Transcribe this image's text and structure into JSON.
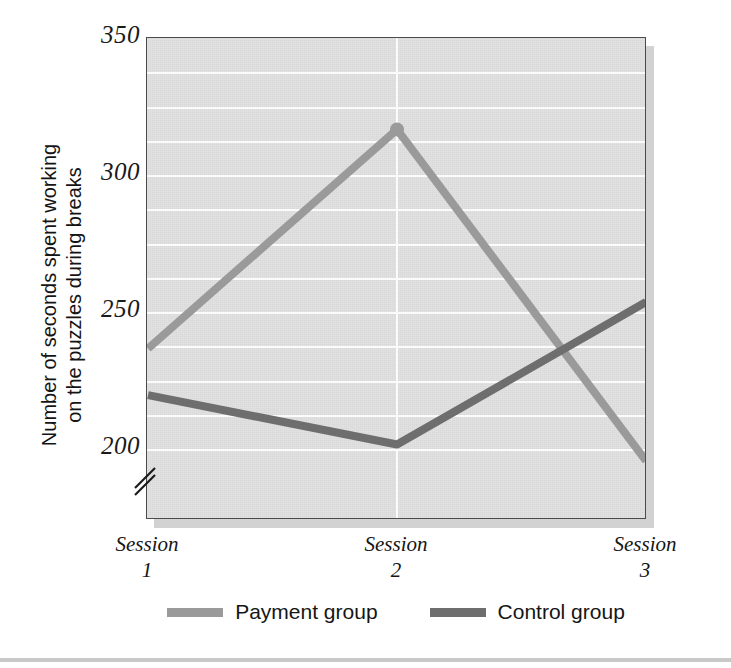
{
  "chart_data": {
    "type": "line",
    "title": "",
    "xlabel": "",
    "ylabel": "Number of seconds spent working on the puzzles during breaks",
    "ylabel_line1": "Number of seconds spent working",
    "ylabel_line2": "on the puzzles during breaks",
    "categories": [
      "Session 1",
      "Session 2",
      "Session 3"
    ],
    "category_lines": [
      {
        "word": "Session",
        "number": "1"
      },
      {
        "word": "Session",
        "number": "2"
      },
      {
        "word": "Session",
        "number": "3"
      }
    ],
    "series": [
      {
        "name": "Payment group",
        "color": "#9a9a9a",
        "values": [
          237,
          317,
          196
        ]
      },
      {
        "name": "Control group",
        "color": "#6e6e6e",
        "values": [
          220,
          202,
          254
        ]
      }
    ],
    "ylim": [
      187,
      350
    ],
    "yticks": [
      200,
      250,
      300,
      350
    ],
    "ytick_labels": [
      "200",
      "250",
      "300",
      "350"
    ],
    "gridlines_minor_step": 12.5,
    "grid": true,
    "grid_color": "#fbfbfb",
    "plot_background": "#e0e0e0",
    "axis_break": true,
    "legend_position": "bottom"
  },
  "legend": {
    "entries": [
      {
        "label": "Payment group",
        "color": "#9a9a9a"
      },
      {
        "label": "Control group",
        "color": "#6e6e6e"
      }
    ]
  },
  "colors": {
    "payment_group": "#9a9a9a",
    "control_group": "#6e6e6e",
    "plot_fill": "#e0e0e0",
    "grid": "#fbfbfb",
    "frame": "#4a4a4a",
    "text": "#151515"
  }
}
